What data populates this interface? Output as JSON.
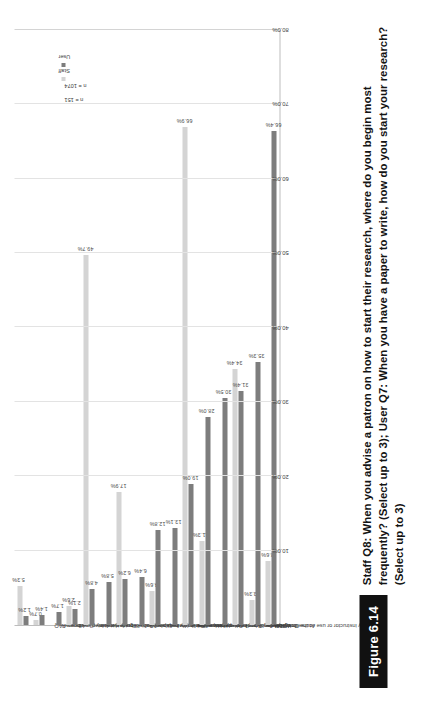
{
  "figure": {
    "tag": "Figure 6.14",
    "caption_bold_lead": "Staff Q8:",
    "caption": "Staff Q8: When you advise a patron on how to start their research, where do you begin most frequently? (Select up to 3); User Q7: When you have a paper to write, how do you start your research? (Select up to 3)"
  },
  "legend": {
    "staff_n": "n = 151",
    "user_n": "n = 1074",
    "staff_label": "Staff",
    "user_label": "User",
    "staff_color": "#d4d4d4",
    "user_color": "#7d7d7d"
  },
  "chart_data": {
    "type": "bar",
    "orientation": "horizontal",
    "title": "",
    "xlabel": "",
    "ylabel": "",
    "xlim": [
      0,
      80
    ],
    "grid": true,
    "legend_position": "top-right",
    "tick_labels": [
      "0.0%",
      "10.0%",
      "20.0%",
      "30.0%",
      "40.0%",
      "50.0%",
      "60.0%",
      "70.0%",
      "80.0%"
    ],
    "tick_values": [
      0,
      10,
      20,
      30,
      40,
      50,
      60,
      70,
      80
    ],
    "categories": [
      "\"How to get started\" web pages",
      "Library FAQ",
      "I ask my parents",
      "Online library tutorials",
      "Library subject guides",
      "I browse the library book shelves",
      "Other (please specify)",
      "I ask a librarian for help",
      "Reference books or encyclopedias",
      "I ask my classmates",
      "At the library home page",
      "Google Scholar",
      "I ask my instructor or use course materials",
      "At the library catalog",
      "Wikipedia",
      "Google"
    ],
    "series": [
      {
        "name": "Staff",
        "color": "#d4d4d4",
        "values": [
          5.3,
          0.7,
          null,
          2.6,
          49.7,
          null,
          17.9,
          null,
          4.6,
          null,
          66.9,
          11.3,
          null,
          34.4,
          3.3,
          8.6
        ],
        "labels": [
          "5.3%",
          "0.7%",
          "",
          "2.6%",
          "49.7%",
          "",
          "17.9%",
          "",
          "4.6%",
          "",
          "66.9%",
          "11.3%",
          "",
          "34.4%",
          "3.3%",
          "8.6%"
        ]
      },
      {
        "name": "User",
        "color": "#7d7d7d",
        "values": [
          1.2,
          1.4,
          1.7,
          2.1,
          4.8,
          5.8,
          6.2,
          6.4,
          12.8,
          13.1,
          19.0,
          28.0,
          30.5,
          31.4,
          35.3,
          66.4
        ],
        "labels": [
          "1.2%",
          "1.4%",
          "1.7%",
          "2.1%",
          "4.8%",
          "5.8%",
          "6.2%",
          "6.4%",
          "12.8%",
          "13.1%",
          "19.0%",
          "28.0%",
          "30.5%",
          "31.4%",
          "35.3%",
          "66.4%"
        ]
      }
    ]
  }
}
